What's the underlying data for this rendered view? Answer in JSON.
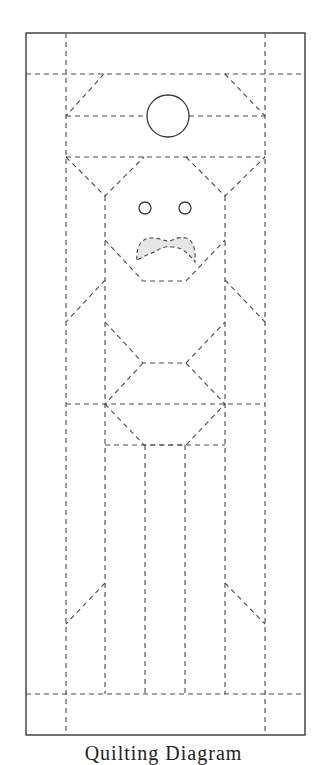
{
  "diagram": {
    "caption": "Quilting Diagram",
    "colors": {
      "background": "#ffffff",
      "line": "#3a3a3a",
      "dashed_line": "#4a4a4a",
      "mustache_fill": "#e6e6e6"
    },
    "outer_border": {
      "x": 26,
      "y": 33,
      "width": 279,
      "height": 702,
      "style": "solid"
    },
    "elements": [
      {
        "name": "sun-circle",
        "shape": "circle",
        "cx": 168,
        "cy": 116,
        "r": 21
      },
      {
        "name": "left-eye",
        "shape": "circle",
        "cx": 145,
        "cy": 208,
        "r": 6
      },
      {
        "name": "right-eye",
        "shape": "circle",
        "cx": 185,
        "cy": 208,
        "r": 6
      },
      {
        "name": "mustache",
        "shape": "shaded-dashed-curve",
        "fill": "#e6e6e6"
      }
    ],
    "legend": {
      "solid_line": "cut edge / outline",
      "dashed_line": "quilting line"
    }
  }
}
